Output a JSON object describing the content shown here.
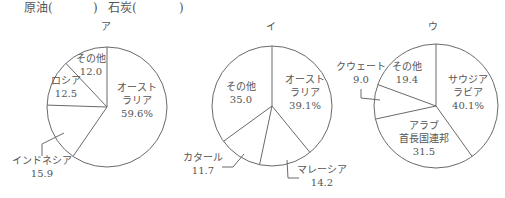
{
  "header": {
    "items": [
      {
        "label": "原油(",
        "x": 24
      },
      {
        "label": ")",
        "x": 93
      },
      {
        "label": "石炭(",
        "x": 108
      },
      {
        "label": ")",
        "x": 179
      }
    ]
  },
  "style": {
    "stroke": "#6a6a6a",
    "text": "#555555",
    "fill": "#ffffff"
  },
  "chart_data": [
    {
      "type": "pie",
      "title": "ア",
      "center": [
        107,
        107
      ],
      "radius": 60,
      "title_pos": [
        106,
        30
      ],
      "slices": [
        {
          "label": "オーストラリア",
          "value": 59.6,
          "lines": [
            "オースト",
            "ラリア",
            "59.6%"
          ],
          "pos": [
            137,
            100
          ]
        },
        {
          "label": "インドネシア",
          "value": 15.9,
          "lines": [
            "インドネシア",
            "15.9"
          ],
          "pos": [
            42,
            166
          ],
          "leader": [
            [
              64,
              133
            ],
            [
              42,
              144
            ],
            [
              42,
              156
            ]
          ]
        },
        {
          "label": "ロシア",
          "value": 12.5,
          "lines": [
            "ロシア",
            "12.5"
          ],
          "pos": [
            66,
            86
          ]
        },
        {
          "label": "その他",
          "value": 12.0,
          "lines": [
            "その他",
            "12.0"
          ],
          "pos": [
            91,
            64
          ]
        }
      ]
    },
    {
      "type": "pie",
      "title": "イ",
      "center": [
        272,
        106
      ],
      "radius": 60,
      "title_pos": [
        271,
        30
      ],
      "slices": [
        {
          "label": "オーストラリア",
          "value": 39.1,
          "lines": [
            "オースト",
            "ラリア",
            "39.1%"
          ],
          "pos": [
            305,
            92
          ]
        },
        {
          "label": "マレーシア",
          "value": 14.2,
          "lines": [
            "マレーシア",
            "14.2"
          ],
          "pos": [
            322,
            175
          ],
          "leader": [
            [
              287,
              160
            ],
            [
              288,
              178
            ],
            [
              299,
              178
            ]
          ]
        },
        {
          "label": "カタール",
          "value": 11.7,
          "lines": [
            "カタール",
            "11.7"
          ],
          "pos": [
            203,
            163
          ],
          "leader": [
            [
              244,
              154
            ],
            [
              233,
              167
            ],
            [
              222,
              167
            ]
          ]
        },
        {
          "label": "その他",
          "value": 35.0,
          "lines": [
            "その他",
            "35.0"
          ],
          "pos": [
            241,
            92
          ]
        }
      ]
    },
    {
      "type": "pie",
      "title": "ウ",
      "center": [
        436,
        106
      ],
      "radius": 62,
      "title_pos": [
        433,
        30
      ],
      "slices": [
        {
          "label": "サウジアラビア",
          "value": 40.1,
          "lines": [
            "サウジア",
            "ラビア",
            "40.1%"
          ],
          "pos": [
            468,
            92
          ]
        },
        {
          "label": "アラブ首長国連邦",
          "value": 31.5,
          "lines": [
            "アラブ",
            "首長国連邦",
            "31.5"
          ],
          "pos": [
            424,
            138
          ]
        },
        {
          "label": "クウェート",
          "value": 9.0,
          "lines": [
            "クウェート",
            "9.0"
          ],
          "pos": [
            361,
            72
          ],
          "leader": [
            [
              361,
              89
            ],
            [
              361,
              98
            ],
            [
              380,
              100
            ]
          ]
        },
        {
          "label": "その他",
          "value": 19.4,
          "lines": [
            "その他",
            "19.4"
          ],
          "pos": [
            407,
            72
          ]
        }
      ]
    }
  ]
}
